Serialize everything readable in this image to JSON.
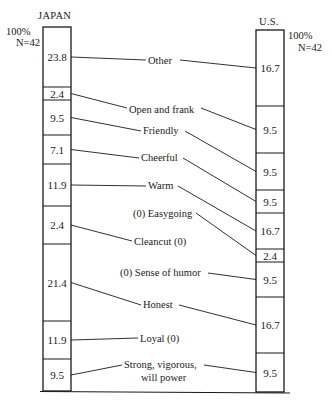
{
  "chart_data": {
    "type": "stacked-bar-comparison",
    "title": "",
    "columns": [
      {
        "name": "JAPAN",
        "total_label": "100%",
        "n_label": "N=42",
        "segments": [
          {
            "trait": "Other",
            "value": 23.8
          },
          {
            "trait": "Open and frank",
            "value": 2.4
          },
          {
            "trait": "Friendly",
            "value": 9.5
          },
          {
            "trait": "Cheerful",
            "value": 7.1
          },
          {
            "trait": "Warm",
            "value": 11.9
          },
          {
            "trait": "Cleancut",
            "value": 2.4
          },
          {
            "trait": "Honest",
            "value": 21.4
          },
          {
            "trait": "Loyal",
            "value": 11.9
          },
          {
            "trait": "Strong, vigorous, will power",
            "value": 9.5
          }
        ]
      },
      {
        "name": "U.S.",
        "total_label": "100%",
        "n_label": "N=42",
        "segments": [
          {
            "trait": "Other",
            "value": 16.7
          },
          {
            "trait": "Open and frank",
            "value": 9.5
          },
          {
            "trait": "Friendly",
            "value": 9.5
          },
          {
            "trait": "Cheerful",
            "value": 9.5
          },
          {
            "trait": "Warm",
            "value": 16.7
          },
          {
            "trait": "Easygoing",
            "value": 2.4
          },
          {
            "trait": "Sense of humor",
            "value": 9.5
          },
          {
            "trait": "Honest",
            "value": 16.7
          },
          {
            "trait": "Strong, vigorous, will power",
            "value": 9.5
          }
        ]
      }
    ],
    "trait_labels": [
      "Other",
      "Open and frank",
      "Friendly",
      "Cheerful",
      "Warm",
      "(0) Easygoing",
      "Cleancut (0)",
      "(0) Sense of humor",
      "Honest",
      "Loyal (0)",
      "Strong, vigorous,",
      "will power"
    ],
    "zero_notes": {
      "japan_zero": [
        "Easygoing",
        "Sense of humor"
      ],
      "us_zero": [
        "Cleancut",
        "Loyal"
      ]
    }
  },
  "layout": {
    "japan": {
      "x": 43,
      "w": 28,
      "bounds": [
        27,
        87,
        100,
        135,
        164,
        206,
        244,
        321,
        359,
        391
      ]
    },
    "us": {
      "x": 256,
      "w": 28,
      "bounds": [
        30,
        106,
        153,
        190,
        213,
        249,
        262,
        297,
        353,
        392
      ]
    }
  },
  "connectors": [
    {
      "label": "Other",
      "lx": 148,
      "ly": 60,
      "lw": 30,
      "j": 0,
      "u": 0
    },
    {
      "label": "Open and frank",
      "lx": 129,
      "ly": 108,
      "lw": 70,
      "j": 1,
      "u": 1
    },
    {
      "label": "Friendly",
      "lx": 143,
      "ly": 131,
      "lw": 40,
      "j": 2,
      "u": 2
    },
    {
      "label": "Cheerful",
      "lx": 141,
      "ly": 158,
      "lw": 40,
      "j": 3,
      "u": 3
    },
    {
      "label": "Warm",
      "lx": 148,
      "ly": 186,
      "lw": 28,
      "j": 4,
      "u": 4
    },
    {
      "label": "(0) Easygoing",
      "lx": 133,
      "ly": 213,
      "lw": 61,
      "j": null,
      "u": 5
    },
    {
      "label": "Cleancut (0)",
      "lx": 134,
      "ly": 241,
      "lw": 54,
      "j": 5,
      "u": null
    },
    {
      "label": "(0) Sense of humor",
      "lx": 120,
      "ly": 273,
      "lw": 86,
      "j": null,
      "u": 6
    },
    {
      "label": "Honest",
      "lx": 143,
      "ly": 305,
      "lw": 34,
      "j": 6,
      "u": 7
    },
    {
      "label": "Loyal (0)",
      "lx": 140,
      "ly": 338,
      "lw": 43,
      "j": 7,
      "u": null
    },
    {
      "label": "Strong, vigorous,",
      "lx": 124,
      "ly": 365,
      "lw": 78,
      "j": 8,
      "u": 8
    }
  ]
}
